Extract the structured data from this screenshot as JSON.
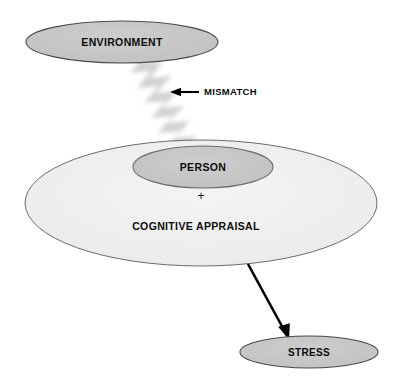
{
  "diagram": {
    "background_color": "#ffffff",
    "nodes": {
      "environment": {
        "label": "ENVIRONMENT",
        "shape": "ellipse",
        "fill": "#c6c6c6",
        "stroke": "#4a4a4a",
        "cx": 122,
        "cy": 42,
        "rx": 96,
        "ry": 21
      },
      "person": {
        "label": "PERSON",
        "shape": "ellipse",
        "fill": "#c6c6c6",
        "stroke": "#6b6b6b",
        "cx": 203,
        "cy": 167,
        "rx": 70,
        "ry": 21
      },
      "cognitive_appraisal": {
        "label": "COGNITIVE APPRAISAL",
        "shape": "ellipse",
        "fill": "#efefef",
        "stroke": "#6b6b6b",
        "cx": 201,
        "cy": 203,
        "rx": 176,
        "ry": 63,
        "label_x": 196,
        "label_y": 227
      },
      "stress": {
        "label": "STRESS",
        "shape": "ellipse",
        "fill": "#c6c6c6",
        "stroke": "#4a4a4a",
        "cx": 309,
        "cy": 352,
        "rx": 69,
        "ry": 16
      }
    },
    "operators": {
      "plus": {
        "symbol": "+",
        "x": 201,
        "y": 197
      }
    },
    "connectors": {
      "mismatch": {
        "label": "MISMATCH",
        "glyph": "lightning-bolt",
        "bolt_fill": "#d0d0d0",
        "arrow_color": "#000000",
        "arrow_tip_x": 171,
        "arrow_tail_x": 199,
        "arrow_y": 92,
        "label_x": 203,
        "label_y": 92
      },
      "stress_arrow": {
        "from": "cognitive_appraisal",
        "to": "stress",
        "color": "#000000",
        "x1": 248,
        "y1": 264,
        "x2": 288,
        "y2": 338
      }
    }
  }
}
